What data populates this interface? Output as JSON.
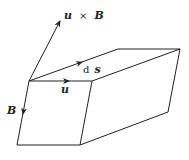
{
  "diagram": {
    "type": "parallelepiped-vectors",
    "labels": {
      "u_cross_B": {
        "u": "u",
        "op": "×",
        "B": "B"
      },
      "ds": {
        "d": "d",
        "s": "s"
      },
      "u": "u",
      "B": "B"
    },
    "colors": {
      "stroke": "#222222",
      "background": "#ffffff"
    }
  }
}
